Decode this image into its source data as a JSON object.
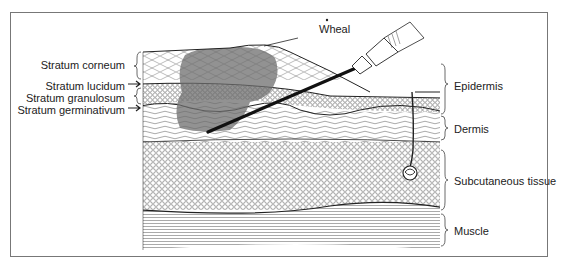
{
  "figure": {
    "left_labels": [
      {
        "id": "stratum-corneum",
        "text": "Stratum corneum"
      },
      {
        "id": "stratum-lucidum",
        "text": "Stratum lucidum"
      },
      {
        "id": "stratum-granulosum",
        "text": "Stratum granulosum"
      },
      {
        "id": "stratum-germinativum",
        "text": "Stratum germinativum"
      }
    ],
    "top_label": {
      "id": "wheal",
      "text": "Wheal"
    },
    "right_labels": [
      {
        "id": "epidermis",
        "text": "Epidermis"
      },
      {
        "id": "dermis",
        "text": "Dermis"
      },
      {
        "id": "subcutaneous-tissue",
        "text": "Subcutaneous tissue"
      },
      {
        "id": "muscle",
        "text": "Muscle"
      }
    ],
    "colors": {
      "ink": "#222222",
      "wheal_shade": "#6e6e6e",
      "frame": "#777777",
      "background": "#ffffff"
    }
  }
}
